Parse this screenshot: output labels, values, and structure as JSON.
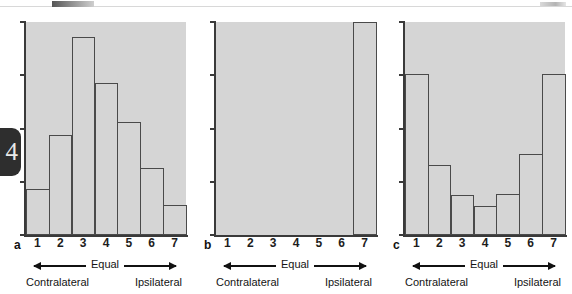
{
  "page_marker": {
    "number": "4"
  },
  "figure": {
    "background_color": "#ffffff",
    "plot_fill_color": "#d5d5d5",
    "bar_outline_color": "#4a4a4a",
    "axis_color": "#3a3a3a"
  },
  "legend": {
    "center_label": "Equal",
    "left_label": "Contralateral",
    "right_label": "Ipsilateral"
  },
  "panels": [
    {
      "letter": "a",
      "x_labels": [
        "1",
        "2",
        "3",
        "4",
        "5",
        "6",
        "7"
      ]
    },
    {
      "letter": "b",
      "x_labels": [
        "1",
        "2",
        "3",
        "4",
        "5",
        "6",
        "7"
      ]
    },
    {
      "letter": "c",
      "x_labels": [
        "1",
        "2",
        "3",
        "4",
        "5",
        "6",
        "7"
      ]
    }
  ],
  "chart_data": [
    {
      "type": "bar",
      "panel": "a",
      "title": "",
      "xlabel": "Equal",
      "ylabel": "",
      "categories": [
        "1",
        "2",
        "3",
        "4",
        "5",
        "6",
        "7"
      ],
      "values": [
        1.5,
        3.3,
        6.5,
        5.0,
        3.7,
        2.2,
        1.0
      ],
      "ylim": [
        0,
        7
      ],
      "yticks": [
        0,
        1.75,
        3.5,
        5.25,
        7
      ],
      "grid": false,
      "legend": "none",
      "annotations": [
        "Contralateral",
        "Equal",
        "Ipsilateral"
      ]
    },
    {
      "type": "bar",
      "panel": "b",
      "title": "",
      "xlabel": "Equal",
      "ylabel": "",
      "categories": [
        "1",
        "2",
        "3",
        "4",
        "5",
        "6",
        "7"
      ],
      "values": [
        0,
        0,
        0,
        0,
        0,
        0,
        7
      ],
      "ylim": [
        0,
        7
      ],
      "yticks": [
        0,
        1.75,
        3.5,
        5.25,
        7
      ],
      "grid": false,
      "legend": "none",
      "annotations": [
        "Contralateral",
        "Equal",
        "Ipsilateral"
      ]
    },
    {
      "type": "bar",
      "panel": "c",
      "title": "",
      "xlabel": "Equal",
      "ylabel": "",
      "categories": [
        "1",
        "2",
        "3",
        "4",
        "5",
        "6",
        "7"
      ],
      "values": [
        5.3,
        2.3,
        1.3,
        0.95,
        1.35,
        2.65,
        5.3
      ],
      "ylim": [
        0,
        7
      ],
      "yticks": [
        0,
        1.75,
        3.5,
        5.25,
        7
      ],
      "grid": false,
      "legend": "none",
      "annotations": [
        "Contralateral",
        "Equal",
        "Ipsilateral"
      ]
    }
  ]
}
